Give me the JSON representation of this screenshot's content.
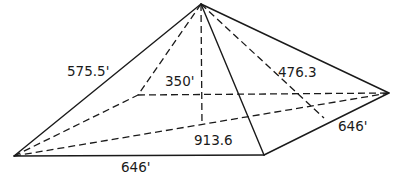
{
  "diagram": {
    "type": "square-pyramid",
    "vertices": {
      "apex": [
        201,
        4
      ],
      "base_left": [
        14,
        156
      ],
      "base_front_right": [
        264,
        155
      ],
      "base_right": [
        389,
        93
      ],
      "base_back_left": [
        138,
        95
      ],
      "height_foot": [
        202,
        125
      ],
      "slant_foot": [
        324,
        118
      ]
    },
    "labels": {
      "lateral_edge": "575.5'",
      "height": "350'",
      "slant_height": "476.3",
      "base_diagonal": "913.6",
      "base_side_right": "646'",
      "base_side_front": "646'"
    },
    "colors": {
      "line": "#1a1a1a",
      "background": "#ffffff"
    }
  }
}
